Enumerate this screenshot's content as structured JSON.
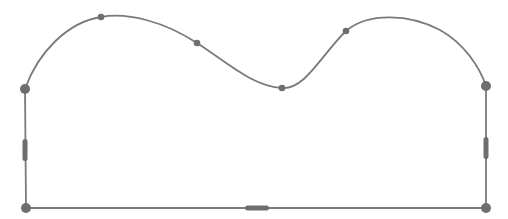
{
  "diagram": {
    "title": "Editable shape outline with curved top edge",
    "stroke_color": "#7a7a7a",
    "node_color": "#6e6e6e",
    "background": "#ffffff",
    "shape": {
      "kind": "closed-path",
      "segments": [
        {
          "name": "top-curve",
          "type": "bezier"
        },
        {
          "name": "right-edge",
          "type": "line"
        },
        {
          "name": "bottom-edge",
          "type": "line"
        },
        {
          "name": "left-edge",
          "type": "line"
        }
      ]
    },
    "corner_anchors": [
      {
        "id": "top-left",
        "x": 25,
        "y": 89
      },
      {
        "id": "top-right",
        "x": 486,
        "y": 86
      },
      {
        "id": "bottom-right",
        "x": 486,
        "y": 208
      },
      {
        "id": "bottom-left",
        "x": 26,
        "y": 208
      }
    ],
    "curve_points": [
      {
        "id": "curve-point-1",
        "x": 101,
        "y": 17
      },
      {
        "id": "curve-point-2",
        "x": 197,
        "y": 43
      },
      {
        "id": "curve-point-3",
        "x": 282,
        "y": 88
      },
      {
        "id": "curve-point-4",
        "x": 346,
        "y": 31
      }
    ],
    "edge_handles": [
      {
        "id": "left-edge-handle",
        "x": 25,
        "y": 150,
        "orientation": "vertical"
      },
      {
        "id": "right-edge-handle",
        "x": 486,
        "y": 148,
        "orientation": "vertical"
      },
      {
        "id": "bottom-edge-handle",
        "x": 257,
        "y": 208,
        "orientation": "horizontal"
      }
    ]
  }
}
